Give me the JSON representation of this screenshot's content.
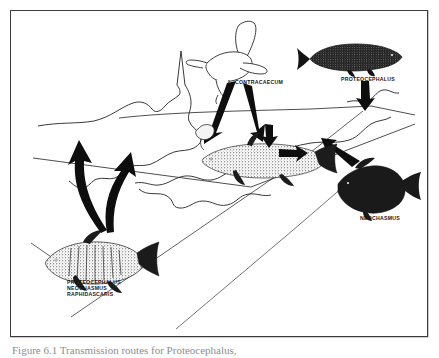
{
  "figure": {
    "domain": "Diagram",
    "type": "parasite-life-cycle-transmission-diagram",
    "caption_clipped": "Figure 6.1 Transmission routes for Proteocephalus,",
    "frame_color": "#3c3c3c",
    "ink_color": "#161616",
    "background": "#ffffff"
  },
  "labels": {
    "contracaecum": "CONTRACAECUM",
    "proteocephalus_top": "PROTEOCEPHALUS",
    "neochasmus": "NEOCHASMUS",
    "host_stack_line1": "PROTEOCEPHALUS",
    "host_stack_line2": "NEOCHASMUS",
    "host_stack_line3": "RAPHIDASCARIS"
  },
  "organisms": [
    {
      "id": "gull",
      "name": "gull-bird",
      "style": "line-drawing",
      "position": "top-center",
      "label": "CONTRACAECUM",
      "role": "definitive-host"
    },
    {
      "id": "burbot",
      "name": "elongate-dark-fish",
      "style": "solid-silhouette",
      "position": "top-right",
      "label": "PROTEOCEPHALUS",
      "role": "host"
    },
    {
      "id": "bass-right",
      "name": "dark-bass-fish",
      "style": "solid-silhouette",
      "position": "right",
      "label": "NEOCHASMUS",
      "role": "host"
    },
    {
      "id": "trout-center",
      "name": "speckled-fish-in-water",
      "style": "stippled",
      "position": "center",
      "label": "",
      "role": "intermediate-host"
    },
    {
      "id": "bass-bottom",
      "name": "striped-bass-fish",
      "style": "stippled",
      "position": "bottom-left",
      "label": "PROTEOCEPHALUS / NEOCHASMUS / RAPHIDASCARIS",
      "role": "host"
    }
  ],
  "arrows": [
    {
      "id": "gull-to-shallow-left",
      "from": "gull",
      "to": "littoral-zone",
      "direction": "down-left",
      "weight": "heavy"
    },
    {
      "id": "gull-to-shallow-right",
      "from": "gull",
      "to": "littoral-zone",
      "direction": "down-right",
      "weight": "heavy"
    },
    {
      "id": "burbot-to-lake",
      "from": "burbot",
      "to": "lake-edge",
      "direction": "down",
      "weight": "heavy"
    },
    {
      "id": "neochasmus-to-lake",
      "from": "bass-right",
      "to": "lake",
      "direction": "up-left",
      "weight": "heavy"
    },
    {
      "id": "bottom-fish-up-left",
      "from": "bass-bottom",
      "to": "lake",
      "direction": "up",
      "weight": "heavy-curved"
    },
    {
      "id": "bottom-fish-up-right",
      "from": "bass-bottom",
      "to": "lake",
      "direction": "up",
      "weight": "heavy-curved"
    },
    {
      "id": "center-down-arrow",
      "from": "surface",
      "to": "trout-center",
      "direction": "down",
      "weight": "medium"
    },
    {
      "id": "center-left-arrow",
      "from": "lake",
      "to": "trout-center",
      "direction": "left",
      "weight": "medium"
    }
  ],
  "scene": {
    "water_body": "perspective lake with shoreline outline",
    "features": [
      "shoreline-outline",
      "depth-lines",
      "island-contours",
      "horizon-line"
    ]
  }
}
